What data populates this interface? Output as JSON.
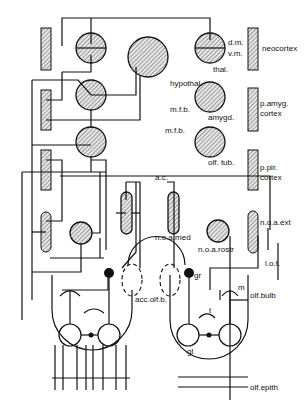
{
  "diagram": {
    "type": "neuroanatomical circuit diagram of the olfactory system",
    "labels": {
      "dm": "d.m.",
      "vm": "v.m.",
      "thal": "thal.",
      "neocortex": "neocortex",
      "hypothal": "hypothal.",
      "amygd": "amygd.",
      "p_amyg_1": "p.amyg.",
      "p_amyg_2": "cortex",
      "mfb_1": "m.f.b.",
      "mfb_2": "m.f.b.",
      "olf_tub": "olf. tub.",
      "p_pir_1": "p.pir.",
      "p_pir_2": "cortex",
      "ac": "a.c.",
      "noa_ext": "n.o.a.ext",
      "noa_med": "n.o.a.med",
      "noa_rostr": "n.o.a.rostr",
      "lot": "l.o.t.",
      "acc_olf_b": "acc.olf.b.",
      "gr": "gr",
      "m": "m",
      "t": "t",
      "gl": "gl",
      "olf_bulb": "olf.bulb",
      "olf_epith": "olf.epith"
    },
    "colors": {
      "line": "#111111",
      "hatch": "#555555",
      "background": "#ffffff"
    }
  }
}
